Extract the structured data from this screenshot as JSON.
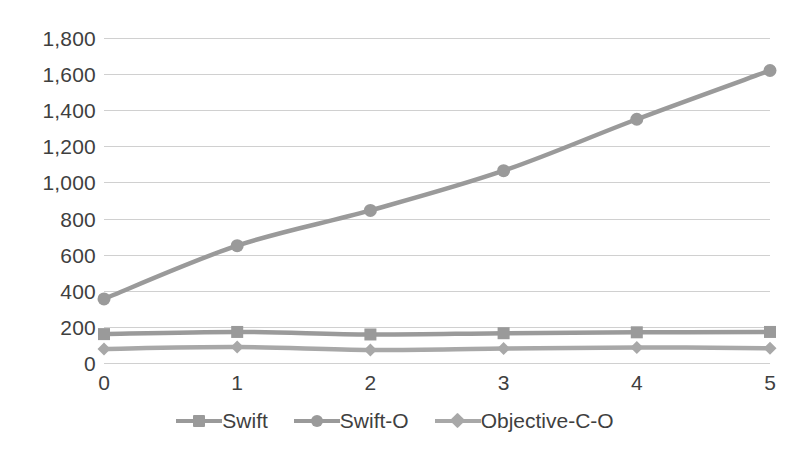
{
  "chart_data": {
    "type": "line",
    "title": "",
    "subtitle": "",
    "xlabel": "",
    "ylabel": "",
    "x": [
      0,
      1,
      2,
      3,
      4,
      5
    ],
    "x_tick_labels": [
      "0",
      "1",
      "2",
      "3",
      "4",
      "5"
    ],
    "xlim": [
      0,
      5
    ],
    "ylim": [
      0,
      1800
    ],
    "y_ticks": [
      0,
      200,
      400,
      600,
      800,
      1000,
      1200,
      1400,
      1600,
      1800
    ],
    "y_tick_labels": [
      "0",
      "200",
      "400",
      "600",
      "800",
      "1,000",
      "1,200",
      "1,400",
      "1,600",
      "1,800"
    ],
    "grid": true,
    "legend_position": "bottom-center",
    "series": [
      {
        "name": "Swift",
        "marker": "square",
        "color": "#9a9a9a",
        "values": [
          160,
          172,
          158,
          165,
          170,
          172
        ]
      },
      {
        "name": "Swift-O",
        "marker": "circle",
        "color": "#9a9a9a",
        "values": [
          355,
          650,
          845,
          1065,
          1350,
          1620
        ]
      },
      {
        "name": "Objective-C-O",
        "marker": "diamond",
        "color": "#a8a8a8",
        "values": [
          78,
          88,
          72,
          80,
          86,
          82
        ]
      }
    ]
  },
  "style": {
    "background": "#ffffff",
    "gridline_color": "#d0d0d0",
    "text_color": "#3f3f3f",
    "series_color": "#9a9a9a"
  }
}
